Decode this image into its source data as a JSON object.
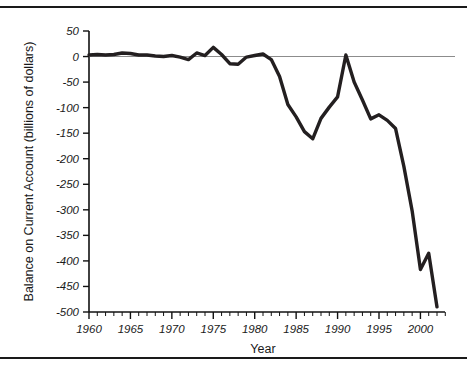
{
  "chart_data": {
    "type": "line",
    "title": "",
    "xlabel": "Year",
    "ylabel": "Balance on Current Account (billions of dollars)",
    "xlim": [
      1960,
      2002
    ],
    "ylim": [
      -500,
      50
    ],
    "grid": false,
    "legend": "none",
    "x_ticks": [
      1960,
      1965,
      1970,
      1975,
      1980,
      1985,
      1990,
      1995,
      2000
    ],
    "x_tick_labels": [
      "1960",
      "1965",
      "1970",
      "1975",
      "1980",
      "1985",
      "1990",
      "1995",
      "2000"
    ],
    "x_minor_tick_step": 1,
    "y_ticks": [
      50,
      0,
      -50,
      -100,
      -150,
      -200,
      -250,
      -300,
      -350,
      -400,
      -450,
      -500
    ],
    "y_tick_labels": [
      "50",
      "0",
      "-50",
      "-100",
      "-150",
      "-200",
      "-250",
      "-300",
      "-350",
      "-400",
      "-450",
      "-500"
    ],
    "zero_reference_line": 0,
    "line_color": "#231f20",
    "axis_color": "#111111",
    "zero_line_color": "#8c8c8c",
    "background_color": "#ffffff",
    "series": [
      {
        "name": "Balance on Current Account",
        "x": [
          1960,
          1961,
          1962,
          1963,
          1964,
          1965,
          1966,
          1967,
          1968,
          1969,
          1970,
          1971,
          1972,
          1973,
          1974,
          1975,
          1976,
          1977,
          1978,
          1979,
          1980,
          1981,
          1982,
          1983,
          1984,
          1985,
          1986,
          1987,
          1988,
          1989,
          1990,
          1991,
          1992,
          1993,
          1994,
          1995,
          1996,
          1997,
          1998,
          1999,
          2000,
          2001,
          2002
        ],
        "values": [
          3,
          4,
          3,
          4,
          7,
          6,
          3,
          3,
          1,
          0,
          2,
          -1,
          -6,
          7,
          2,
          18,
          4,
          -14,
          -15,
          -1,
          2,
          5,
          -6,
          -39,
          -94,
          -118,
          -147,
          -161,
          -121,
          -99,
          -79,
          3,
          -50,
          -85,
          -122,
          -114,
          -125,
          -141,
          -215,
          -302,
          -417,
          -385,
          -490
        ],
        "units": "billions of dollars"
      }
    ],
    "annotations": {
      "peak_surplus_year": 1975,
      "peak_surplus_value": 18,
      "mid_trough_year": 1987,
      "mid_trough_value": -161,
      "recovery_year": 1991,
      "recovery_value": 3,
      "final_year": 2002,
      "final_value": -490
    }
  },
  "figure": {
    "top_rule": "",
    "bottom_rule": ""
  }
}
